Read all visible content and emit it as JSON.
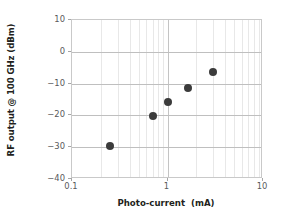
{
  "chart_data": {
    "type": "scatter",
    "title": "",
    "xlabel": "Photo-current  (mA)",
    "ylabel": "RF output @ 100 GHz (dBm)",
    "xscale": "log",
    "yscale": "linear",
    "xlim": [
      0.1,
      10
    ],
    "ylim": [
      -40,
      10
    ],
    "grid": true,
    "legend": null,
    "xticks": [
      {
        "value": 0.1,
        "label": "0.1"
      },
      {
        "value": 1,
        "label": "1"
      },
      {
        "value": 10,
        "label": "10"
      }
    ],
    "yticks": [
      {
        "value": 10,
        "label": "10"
      },
      {
        "value": 0,
        "label": "0"
      },
      {
        "value": -10,
        "label": "−10"
      },
      {
        "value": -20,
        "label": "−20"
      },
      {
        "value": -30,
        "label": "−30"
      },
      {
        "value": -40,
        "label": "−40"
      }
    ],
    "x": [
      0.25,
      0.7,
      1.02,
      1.65,
      3.0
    ],
    "y": [
      -29.5,
      -20.2,
      -15.8,
      -11.4,
      -6.2
    ],
    "series": [
      {
        "name": "RF output",
        "marker": "filled-circle",
        "color": "#3b3b3b",
        "points": [
          {
            "x": 0.25,
            "y": -29.5
          },
          {
            "x": 0.7,
            "y": -20.2
          },
          {
            "x": 1.02,
            "y": -15.8
          },
          {
            "x": 1.65,
            "y": -11.4
          },
          {
            "x": 3.0,
            "y": -6.2
          }
        ]
      }
    ]
  },
  "style": {
    "marker_color": "#3b3b3b",
    "grid_major_color": "#bfbfbf",
    "grid_minor_color": "#e8e8e8",
    "axis_border_color": "#c9c9c9",
    "tick_label_color": "#58595b",
    "axis_title_color": "#231f20",
    "background": "#ffffff"
  }
}
